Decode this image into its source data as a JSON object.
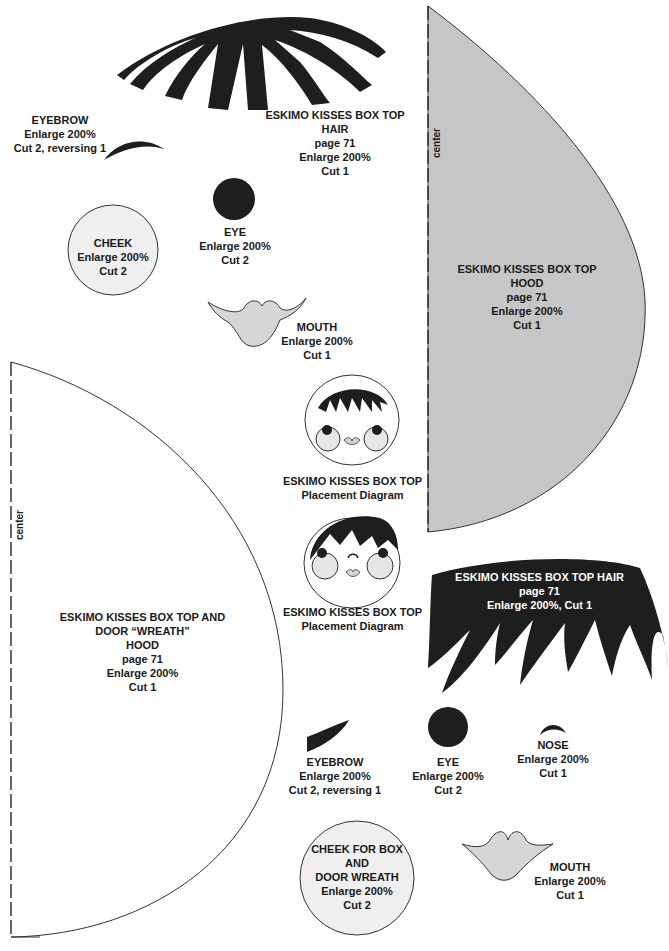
{
  "colors": {
    "black_piece": "#1e1e1e",
    "gray_piece": "#c6c6c6",
    "light_piece": "#efefef",
    "mouth_fill": "#d6d6d6",
    "outline": "#333333"
  },
  "pieces": {
    "top_hair": {
      "shape_icon": "hair-fringe-icon",
      "lines": [
        "ESKIMO KISSES BOX TOP",
        "HAIR",
        "page 71",
        "Enlarge 200%",
        "Cut 1"
      ]
    },
    "top_eyebrow": {
      "shape_icon": "eyebrow-icon",
      "lines": [
        "EYEBROW",
        "Enlarge 200%",
        "Cut 2, reversing 1"
      ]
    },
    "top_eye": {
      "shape_icon": "eye-circle-icon",
      "lines": [
        "EYE",
        "Enlarge 200%",
        "Cut 2"
      ]
    },
    "top_cheek": {
      "shape_icon": "cheek-circle-icon",
      "lines": [
        "CHEEK",
        "Enlarge 200%",
        "Cut 2"
      ]
    },
    "top_mouth": {
      "shape_icon": "mouth-icon",
      "lines": [
        "MOUTH",
        "Enlarge 200%",
        "Cut 1"
      ]
    },
    "gray_hood": {
      "shape_icon": "hood-quarter-icon",
      "center_label": "center",
      "lines": [
        "ESKIMO KISSES BOX TOP",
        "HOOD",
        "page 71",
        "Enlarge 200%",
        "Cut 1"
      ]
    },
    "white_hood": {
      "shape_icon": "hood-quarter-icon",
      "center_label": "center",
      "lines": [
        "ESKIMO KISSES BOX TOP AND",
        "DOOR “WREATH”",
        "HOOD",
        "page 71",
        "Enlarge 200%",
        "Cut 1"
      ]
    },
    "diagram_1": {
      "shape_icon": "face-diagram-icon",
      "lines": [
        "ESKIMO KISSES BOX TOP",
        "Placement Diagram"
      ]
    },
    "diagram_2": {
      "shape_icon": "face-diagram-icon",
      "lines": [
        "ESKIMO KISSES BOX TOP",
        "Placement Diagram"
      ]
    },
    "bottom_hair": {
      "shape_icon": "hair-bangs-icon",
      "lines": [
        "ESKIMO KISSES BOX TOP HAIR",
        "page 71",
        "Enlarge 200%, Cut 1"
      ]
    },
    "bottom_eyebrow": {
      "shape_icon": "eyebrow-icon",
      "lines": [
        "EYEBROW",
        "Enlarge 200%",
        "Cut 2, reversing 1"
      ]
    },
    "bottom_eye": {
      "shape_icon": "eye-circle-icon",
      "lines": [
        "EYE",
        "Enlarge 200%",
        "Cut 2"
      ]
    },
    "bottom_nose": {
      "shape_icon": "nose-icon",
      "lines": [
        "NOSE",
        "Enlarge 200%",
        "Cut 1"
      ]
    },
    "bottom_cheek": {
      "shape_icon": "cheek-circle-icon",
      "lines": [
        "CHEEK FOR BOX",
        "AND",
        "DOOR WREATH",
        "Enlarge 200%",
        "Cut 2"
      ]
    },
    "bottom_mouth": {
      "shape_icon": "mouth-icon",
      "lines": [
        "MOUTH",
        "Enlarge 200%",
        "Cut 1"
      ]
    }
  }
}
